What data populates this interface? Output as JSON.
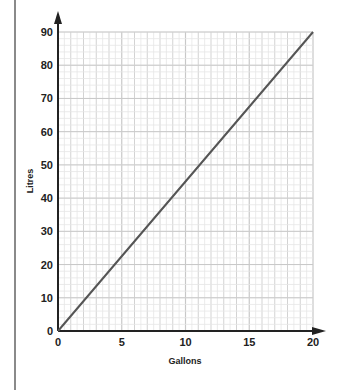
{
  "chart_data": {
    "type": "line",
    "title": "",
    "xlabel": "Gallons",
    "ylabel": "Litres",
    "xlim": [
      0,
      20
    ],
    "ylim": [
      0,
      90
    ],
    "x_ticks": [
      "0",
      "5",
      "10",
      "15",
      "20"
    ],
    "y_ticks": [
      "0",
      "10",
      "20",
      "30",
      "40",
      "50",
      "60",
      "70",
      "80",
      "90"
    ],
    "grid": true,
    "legend": null,
    "series": [
      {
        "name": "Gallons to Litres",
        "x": [
          0,
          5,
          10,
          15,
          20
        ],
        "y": [
          0,
          22.5,
          45,
          67.5,
          90
        ],
        "color": "#555555"
      }
    ]
  },
  "colors": {
    "axis": "#222222",
    "grid_major": "#c8c8c8",
    "grid_minor": "#e6e6e6",
    "line": "#555555",
    "side_rule": "#8a8a8a"
  }
}
